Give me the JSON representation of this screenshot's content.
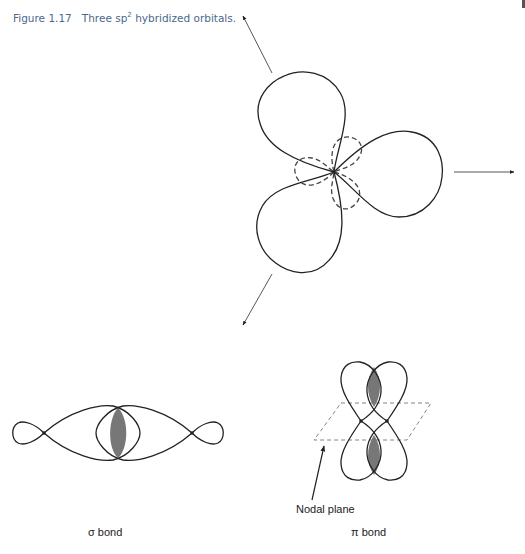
{
  "caption": {
    "figure_number": "Figure 1.17",
    "text_before_sup": "Three sp",
    "superscript": "2",
    "text_after_sup": " hybridized orbitals."
  },
  "diagrams": {
    "sp2": {
      "description": "Three sp2 hybridized orbitals at 120 degrees with small dashed back lobes and direction arrows",
      "lobe_count": 3,
      "arrow_directions_deg": [
        120,
        0,
        240
      ]
    },
    "sigma_bond": {
      "label": "σ bond"
    },
    "pi_bond": {
      "label": "π bond",
      "nodal_plane_label": "Nodal plane"
    }
  },
  "colors": {
    "caption": "#4a6a8a",
    "line": "#222222",
    "shading": "#777777",
    "dashed": "#555555"
  }
}
